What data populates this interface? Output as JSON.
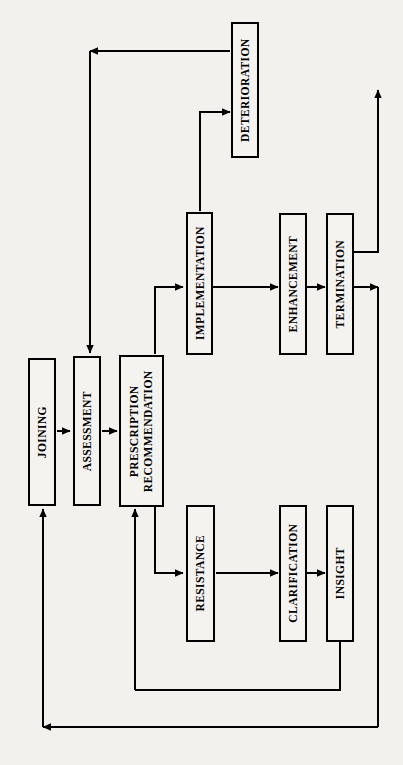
{
  "diagram": {
    "orientation": "rotated-90-ccw",
    "background_color": "#f2f1ee",
    "line_color": "#000000",
    "box_fill": "#f4f3f0",
    "nodes": [
      {
        "id": "joining",
        "label": "JOINING"
      },
      {
        "id": "assessment",
        "label": "ASSESSMENT"
      },
      {
        "id": "prescription",
        "label": "PRESCRIPTION\nRECOMMENDATION"
      },
      {
        "id": "implementation",
        "label": "IMPLEMENTATION"
      },
      {
        "id": "deterioration",
        "label": "DETERIORATION"
      },
      {
        "id": "enhancement",
        "label": "ENHANCEMENT"
      },
      {
        "id": "termination",
        "label": "TERMINATION"
      },
      {
        "id": "resistance",
        "label": "RESISTANCE"
      },
      {
        "id": "clarification",
        "label": "CLARIFICATION"
      },
      {
        "id": "insight",
        "label": "INSIGHT"
      }
    ],
    "edges": [
      {
        "from": "joining",
        "to": "assessment"
      },
      {
        "from": "assessment",
        "to": "prescription"
      },
      {
        "from": "prescription",
        "to": "implementation"
      },
      {
        "from": "prescription",
        "to": "resistance"
      },
      {
        "from": "implementation",
        "to": "deterioration"
      },
      {
        "from": "implementation",
        "to": "enhancement"
      },
      {
        "from": "enhancement",
        "to": "termination"
      },
      {
        "from": "termination",
        "to": "exit-up"
      },
      {
        "from": "termination",
        "to": "exit-down"
      },
      {
        "from": "resistance",
        "to": "clarification"
      },
      {
        "from": "clarification",
        "to": "insight"
      },
      {
        "from": "insight",
        "to": "prescription"
      },
      {
        "from": "deterioration",
        "to": "assessment"
      },
      {
        "from": "termination",
        "to": "joining"
      }
    ]
  }
}
